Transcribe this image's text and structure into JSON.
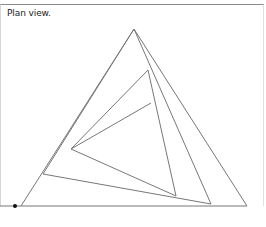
{
  "diagram": {
    "caption": "Plan view.",
    "colors": {
      "line": "#777777",
      "dot": "#111111",
      "frame_top": "#8a8a8a"
    },
    "triangles": [
      {
        "name": "outer",
        "points": [
          [
            134,
            29
          ],
          [
            21,
            206
          ],
          [
            247,
            206
          ]
        ]
      },
      {
        "name": "second",
        "points": [
          [
            134,
            29
          ],
          [
            43,
            174
          ],
          [
            211,
            204
          ]
        ]
      },
      {
        "name": "third",
        "points": [
          [
            148,
            70
          ],
          [
            71,
            149
          ],
          [
            176,
            196
          ]
        ]
      }
    ],
    "open_segments": [
      {
        "from": [
          151,
          103
        ],
        "to": [
          71,
          149
        ]
      }
    ],
    "reference_line": {
      "from": [
        0,
        206
      ],
      "to": [
        21,
        206
      ]
    },
    "reference_dot": {
      "x": 15,
      "y": 206,
      "r": 2
    }
  }
}
